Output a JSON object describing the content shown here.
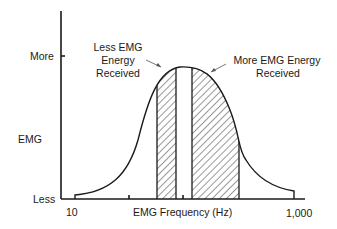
{
  "diagram": {
    "title": "",
    "y_axis": {
      "label": "EMG",
      "top_label": "More",
      "bottom_label": "Less"
    },
    "x_axis": {
      "label": "EMG Frequency (Hz)",
      "min_label": "10",
      "max_label": "1,000"
    },
    "annotations": [
      {
        "id": "less",
        "lines": [
          "Less EMG",
          "Energy",
          "Received"
        ]
      },
      {
        "id": "more",
        "lines": [
          "More EMG Energy",
          "Received"
        ]
      }
    ],
    "bands": [
      {
        "name": "narrow-band",
        "pattern": "hatched",
        "x_start": 157,
        "x_end": 176
      },
      {
        "name": "wide-band",
        "pattern": "hatched",
        "x_start": 192,
        "x_end": 239
      }
    ],
    "colors": {
      "ink": "#1a1a1a",
      "background": "#ffffff"
    }
  }
}
